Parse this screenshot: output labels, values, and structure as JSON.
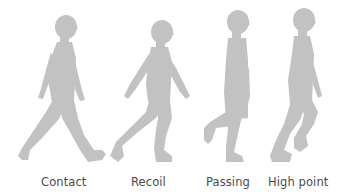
{
  "diagram": {
    "silhouette_color": "#c2c2c2",
    "label_color": "#4a4a4a",
    "background": "#ffffff",
    "poses": [
      {
        "label": "Contact",
        "icon": "walking-child-silhouette-contact"
      },
      {
        "label": "Recoil",
        "icon": "walking-child-silhouette-recoil"
      },
      {
        "label": "Passing",
        "icon": "walking-child-silhouette-passing"
      },
      {
        "label": "High point",
        "icon": "walking-child-silhouette-high-point"
      }
    ]
  }
}
